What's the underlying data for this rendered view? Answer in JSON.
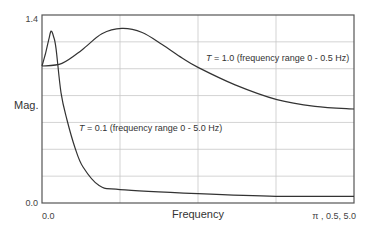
{
  "chart_data": {
    "type": "line",
    "title": "",
    "xlabel": "Frequency",
    "ylabel": "Mag.",
    "ylim": [
      0.0,
      1.4
    ],
    "xlim_fraction": [
      0.0,
      1.0
    ],
    "y_tick_labels": [
      "0.0",
      "1.4"
    ],
    "x_tick_labels": {
      "left": "0.0",
      "right": "π , 0.5, 5.0"
    },
    "grid": {
      "on": true,
      "vertical_divisions": 4,
      "horizontal_divisions": 7
    },
    "series": [
      {
        "name": "T = 1.0 (frequency range 0 - 0.5 Hz)",
        "label_prefix": "T",
        "label_rest": " = 1.0 (frequency range 0 - 0.5 Hz)",
        "x": [
          0.0,
          0.064,
          0.128,
          0.192,
          0.256,
          0.321,
          0.385,
          0.449,
          0.5,
          0.619,
          0.753,
          0.875,
          1.0
        ],
        "values": [
          1.02,
          1.04,
          1.14,
          1.26,
          1.3,
          1.27,
          1.18,
          1.08,
          1.01,
          0.88,
          0.77,
          0.72,
          0.7
        ]
      },
      {
        "name": "T = 0.1 (frequency range 0 - 5.0 Hz)",
        "label_prefix": "T",
        "label_rest": " = 0.1 (frequency range 0 - 5.0 Hz)",
        "x": [
          0.0,
          0.012,
          0.022,
          0.029,
          0.037,
          0.045,
          0.061,
          0.08,
          0.106,
          0.131,
          0.183,
          0.25,
          0.5,
          0.75,
          1.0
        ],
        "values": [
          1.02,
          1.12,
          1.22,
          1.28,
          1.24,
          1.15,
          0.82,
          0.62,
          0.41,
          0.27,
          0.13,
          0.1,
          0.07,
          0.05,
          0.05
        ]
      }
    ],
    "colors": {
      "curve": "#333333",
      "grid": "#c8c8c8",
      "frame": "#555555"
    }
  }
}
